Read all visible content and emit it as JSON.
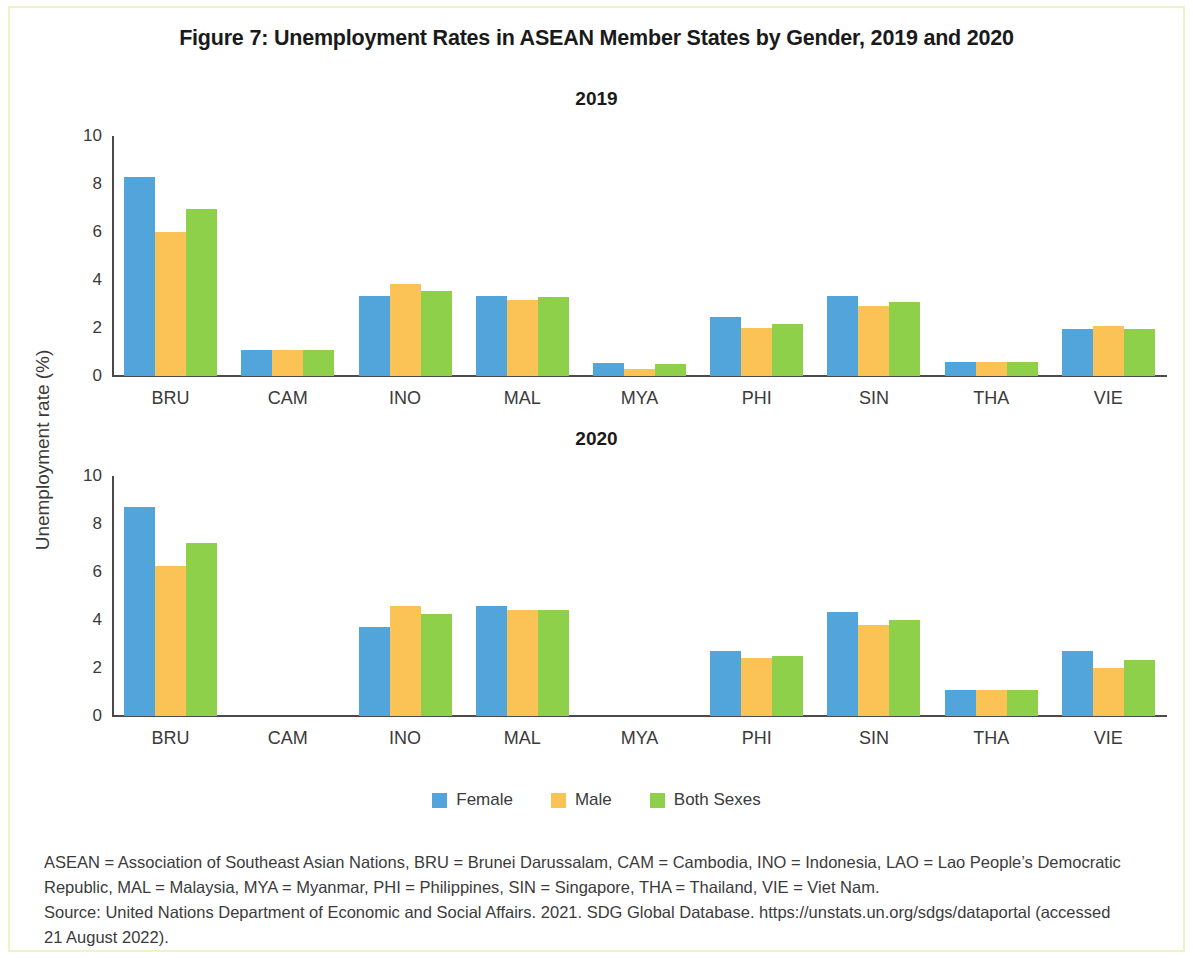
{
  "figure": {
    "title": "Figure 7: Unemployment Rates in ASEAN Member States by Gender, 2019 and 2020"
  },
  "legend": {
    "items": [
      {
        "label": "Female",
        "color": "#52a5db"
      },
      {
        "label": "Male",
        "color": "#fbc355"
      },
      {
        "label": "Both Sexes",
        "color": "#8ed04a"
      }
    ]
  },
  "notes": {
    "line1": "ASEAN = Association of Southeast Asian Nations, BRU = Brunei Darussalam, CAM = Cambodia, INO = Indonesia, LAO = Lao People’s Democratic",
    "line2": "Republic, MAL = Malaysia, MYA = Myanmar, PHI = Philippines, SIN = Singapore, THA = Thailand, VIE = Viet Nam.",
    "line3": "Source: United Nations Department of Economic and Social Affairs. 2021. SDG Global Database. https://unstats.un.org/sdgs/dataportal (accessed",
    "line4": "21 August 2022)."
  },
  "chart_data": [
    {
      "type": "bar",
      "title": "2019",
      "xlabel": "",
      "ylabel": "Unemployment rate (%)",
      "ylim": [
        0,
        10
      ],
      "yticks": [
        0,
        2,
        4,
        6,
        8,
        10
      ],
      "grid": false,
      "legend_position": "bottom",
      "categories": [
        "BRU",
        "CAM",
        "INO",
        "MAL",
        "MYA",
        "PHI",
        "SIN",
        "THA",
        "VIE"
      ],
      "series": [
        {
          "name": "Female",
          "color": "#52a5db",
          "values": [
            8.3,
            1.1,
            3.35,
            3.35,
            0.55,
            2.45,
            3.35,
            0.6,
            1.95
          ]
        },
        {
          "name": "Male",
          "color": "#fbc355",
          "values": [
            6.0,
            1.1,
            3.85,
            3.15,
            0.3,
            2.0,
            2.9,
            0.6,
            2.1
          ]
        },
        {
          "name": "Both Sexes",
          "color": "#8ed04a",
          "values": [
            6.95,
            1.1,
            3.55,
            3.3,
            0.5,
            2.15,
            3.1,
            0.6,
            1.95
          ]
        }
      ]
    },
    {
      "type": "bar",
      "title": "2020",
      "xlabel": "",
      "ylabel": "Unemployment rate (%)",
      "ylim": [
        0,
        10
      ],
      "yticks": [
        0,
        2,
        4,
        6,
        8,
        10
      ],
      "grid": false,
      "legend_position": "bottom",
      "categories": [
        "BRU",
        "CAM",
        "INO",
        "MAL",
        "MYA",
        "PHI",
        "SIN",
        "THA",
        "VIE"
      ],
      "series": [
        {
          "name": "Female",
          "color": "#52a5db",
          "values": [
            8.7,
            null,
            3.7,
            4.6,
            null,
            2.7,
            4.35,
            1.1,
            2.7
          ]
        },
        {
          "name": "Male",
          "color": "#fbc355",
          "values": [
            6.25,
            null,
            4.6,
            4.4,
            null,
            2.4,
            3.8,
            1.1,
            2.0
          ]
        },
        {
          "name": "Both Sexes",
          "color": "#8ed04a",
          "values": [
            7.2,
            null,
            4.25,
            4.4,
            null,
            2.5,
            4.0,
            1.1,
            2.35
          ]
        }
      ]
    }
  ]
}
